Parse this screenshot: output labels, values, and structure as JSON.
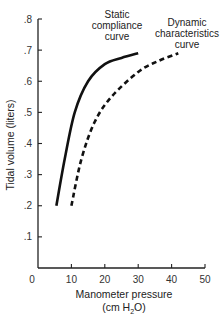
{
  "chart_data": {
    "type": "line",
    "title": "",
    "xlabel": "Manometer pressure",
    "xlabel_unit": "(cm H2O)",
    "ylabel": "Tidal volume (liters)",
    "xlim": [
      0,
      50
    ],
    "ylim": [
      0,
      0.8
    ],
    "x_ticks": [
      0,
      10,
      20,
      30,
      40,
      50
    ],
    "x_tick_labels": [
      "0",
      "10",
      "20",
      "30",
      "40",
      "50"
    ],
    "y_ticks": [
      0.1,
      0.2,
      0.3,
      0.4,
      0.5,
      0.6,
      0.7,
      0.8
    ],
    "y_tick_labels": [
      ".1",
      ".2",
      ".3",
      ".4",
      ".5",
      ".6",
      ".7",
      ".8"
    ],
    "grid": false,
    "legend": "none (direct annotations)",
    "series": [
      {
        "name": "Static compliance curve",
        "style": "solid",
        "color": "#111111",
        "x": [
          5.5,
          8,
          11,
          15,
          20,
          25,
          30
        ],
        "y": [
          0.2,
          0.35,
          0.5,
          0.6,
          0.655,
          0.675,
          0.69
        ]
      },
      {
        "name": "Dynamic characteristics curve",
        "style": "dashed",
        "color": "#111111",
        "x": [
          10,
          13,
          17,
          22,
          30,
          36,
          42
        ],
        "y": [
          0.2,
          0.35,
          0.47,
          0.55,
          0.63,
          0.665,
          0.69
        ]
      }
    ],
    "annotations": [
      {
        "lines": [
          "Static",
          "compliance",
          "curve"
        ],
        "target": "Static compliance curve"
      },
      {
        "lines": [
          "Dynamic",
          "characteristics",
          "curve"
        ],
        "target": "Dynamic characteristics curve"
      }
    ]
  }
}
